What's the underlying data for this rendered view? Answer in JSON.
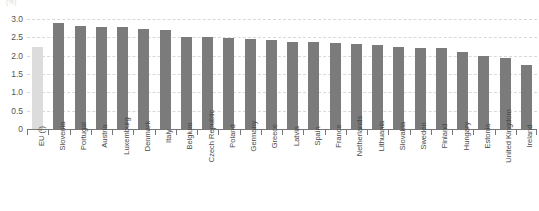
{
  "unit_label": "(%)",
  "chart_data": {
    "type": "bar",
    "title": "",
    "xlabel": "",
    "ylabel": "",
    "ylim": [
      0,
      3.0
    ],
    "grid": true,
    "legend": "none",
    "ytick_labels": [
      "3.0",
      "2.5",
      "2.0",
      "1.5",
      "1.0",
      "0.5",
      "0"
    ],
    "ytick_values": [
      3.0,
      2.5,
      2.0,
      1.5,
      1.0,
      0.5,
      0
    ],
    "categories": [
      "EU (²)",
      "Slovenia",
      "Portugal",
      "Austria",
      "Luxemburg",
      "Denmark",
      "Italy",
      "Belgium",
      "Czech Republic",
      "Poland",
      "Germany",
      "Greece",
      "Latvia",
      "Spain",
      "France",
      "Netherlands",
      "Lithuania",
      "Slovakia",
      "Sweden",
      "Finland",
      "Hungary",
      "Estonia",
      "United Kingdom",
      "Ireland"
    ],
    "values": [
      2.25,
      2.9,
      2.8,
      2.78,
      2.78,
      2.72,
      2.7,
      2.52,
      2.5,
      2.47,
      2.45,
      2.42,
      2.38,
      2.36,
      2.34,
      2.33,
      2.28,
      2.25,
      2.22,
      2.2,
      2.1,
      2.0,
      1.95,
      1.75
    ],
    "highlight_index": 0,
    "colors": {
      "bar": "#7b7b7b",
      "highlight_bar": "#dcdcdc",
      "gridline": "#d9d9d9",
      "axis": "#777777",
      "tick_text": "#555555",
      "label_text": "#4a4a4a"
    }
  }
}
